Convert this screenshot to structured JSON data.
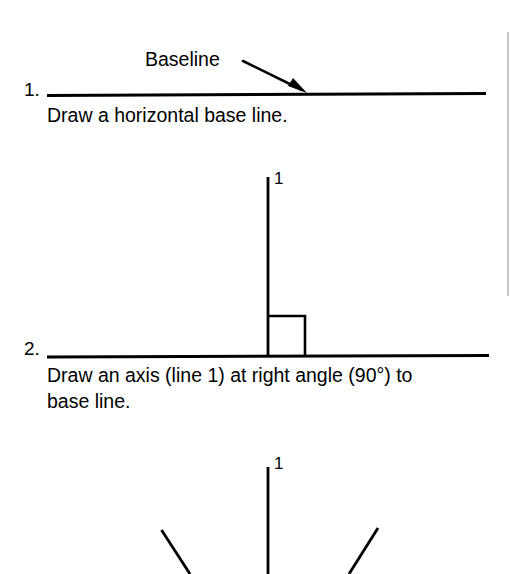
{
  "page": {
    "background_color": "#ffffff",
    "ink_color": "#000000",
    "width": 516,
    "height": 574,
    "margin_rule_color": "#b4b4b4"
  },
  "steps": [
    {
      "number": "1.",
      "caption": "Draw a horizontal base line.",
      "annotation": {
        "label": "Baseline",
        "points_to": "horizontal base line"
      },
      "elements": {
        "base_line": "horizontal",
        "arrow": "leader-arrow"
      }
    },
    {
      "number": "2.",
      "caption_lines": [
        "Draw an axis (line 1) at right angle (90°) to",
        "base line."
      ],
      "axis_label": "1",
      "elements": {
        "base_line": "horizontal",
        "axis_line": "vertical",
        "right_angle_marker": "square"
      }
    },
    {
      "number": "3.",
      "axis_label": "1",
      "elements": {
        "axis_line": "vertical",
        "left_diagonal": "diagonal-down-right",
        "right_diagonal": "diagonal-down-left"
      }
    }
  ]
}
